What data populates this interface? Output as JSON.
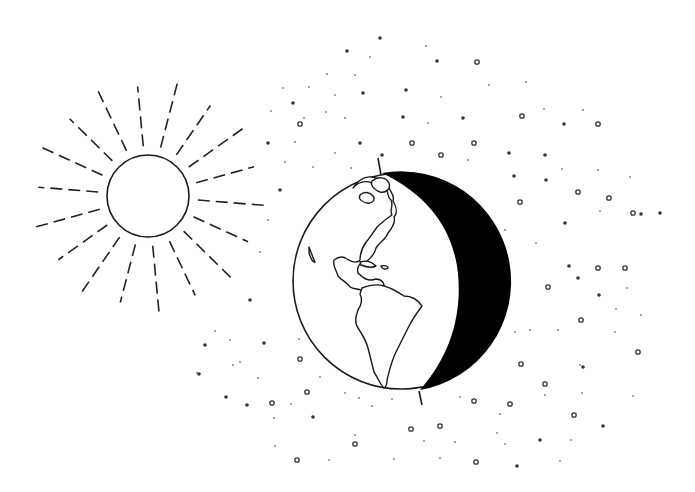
{
  "illustration": {
    "subject": "Sun illuminating Earth, night side shaded",
    "colors": {
      "background": "#ffffff",
      "ink": "#1a1a1a",
      "night": "#000000"
    },
    "sun": {
      "cx": 148,
      "cy": 196,
      "r": 41,
      "ray_inner": 50,
      "ray_outer": 118,
      "ray_count": 18
    },
    "earth": {
      "cx": 401,
      "cy": 281,
      "r": 108,
      "axis_top": [
        378,
        158,
        381,
        175
      ],
      "axis_bottom": [
        419,
        391,
        422,
        405
      ]
    },
    "stars": [
      [
        380,
        38,
        2,
        "d"
      ],
      [
        347,
        51,
        2,
        "d"
      ],
      [
        426,
        46,
        1,
        "p"
      ],
      [
        370,
        57,
        1,
        "p"
      ],
      [
        437,
        61,
        2,
        "d"
      ],
      [
        477,
        62,
        2,
        "r"
      ],
      [
        327,
        74,
        1,
        "p"
      ],
      [
        355,
        75,
        1,
        "p"
      ],
      [
        283,
        88,
        1,
        "p"
      ],
      [
        309,
        87,
        1,
        "p"
      ],
      [
        363,
        93,
        2,
        "d"
      ],
      [
        406,
        90,
        2,
        "d"
      ],
      [
        489,
        85,
        1,
        "p"
      ],
      [
        526,
        82,
        1,
        "p"
      ],
      [
        293,
        103,
        2,
        "d"
      ],
      [
        335,
        95,
        1,
        "p"
      ],
      [
        441,
        97,
        1,
        "p"
      ],
      [
        271,
        111,
        1,
        "p"
      ],
      [
        304,
        118,
        1,
        "p"
      ],
      [
        326,
        112,
        1,
        "p"
      ],
      [
        345,
        118,
        1,
        "p"
      ],
      [
        403,
        117,
        2,
        "d"
      ],
      [
        428,
        123,
        1,
        "p"
      ],
      [
        463,
        118,
        2,
        "d"
      ],
      [
        522,
        116,
        2,
        "r"
      ],
      [
        564,
        124,
        2,
        "d"
      ],
      [
        598,
        124,
        2,
        "r"
      ],
      [
        583,
        110,
        1,
        "p"
      ],
      [
        544,
        109,
        1,
        "p"
      ],
      [
        300,
        124,
        2,
        "r"
      ],
      [
        268,
        143,
        2,
        "d"
      ],
      [
        295,
        142,
        1,
        "p"
      ],
      [
        360,
        143,
        2,
        "d"
      ],
      [
        412,
        143,
        2,
        "r"
      ],
      [
        474,
        143,
        2,
        "r"
      ],
      [
        335,
        153,
        1,
        "p"
      ],
      [
        382,
        155,
        2,
        "d"
      ],
      [
        441,
        155,
        2,
        "r"
      ],
      [
        509,
        153,
        2,
        "d"
      ],
      [
        545,
        155,
        2,
        "d"
      ],
      [
        562,
        169,
        1,
        "p"
      ],
      [
        598,
        170,
        1,
        "p"
      ],
      [
        285,
        162,
        1,
        "p"
      ],
      [
        313,
        167,
        1,
        "p"
      ],
      [
        351,
        168,
        1,
        "p"
      ],
      [
        468,
        160,
        1,
        "p"
      ],
      [
        630,
        177,
        1,
        "p"
      ],
      [
        660,
        213,
        2,
        "d"
      ],
      [
        514,
        176,
        2,
        "d"
      ],
      [
        546,
        180,
        2,
        "d"
      ],
      [
        578,
        192,
        2,
        "r"
      ],
      [
        609,
        198,
        2,
        "r"
      ],
      [
        520,
        202,
        2,
        "r"
      ],
      [
        565,
        223,
        2,
        "d"
      ],
      [
        600,
        211,
        1,
        "p"
      ],
      [
        633,
        213,
        2,
        "r"
      ],
      [
        641,
        214,
        2,
        "d"
      ],
      [
        536,
        243,
        1,
        "p"
      ],
      [
        569,
        266,
        2,
        "d"
      ],
      [
        598,
        268,
        2,
        "r"
      ],
      [
        548,
        287,
        2,
        "r"
      ],
      [
        578,
        278,
        2,
        "d"
      ],
      [
        599,
        295,
        2,
        "d"
      ],
      [
        627,
        288,
        1,
        "p"
      ],
      [
        616,
        309,
        1,
        "p"
      ],
      [
        641,
        315,
        1,
        "p"
      ],
      [
        581,
        320,
        2,
        "r"
      ],
      [
        515,
        332,
        1,
        "p"
      ],
      [
        530,
        330,
        1,
        "p"
      ],
      [
        558,
        330,
        1,
        "p"
      ],
      [
        615,
        332,
        1,
        "p"
      ],
      [
        638,
        352,
        2,
        "r"
      ],
      [
        521,
        364,
        2,
        "r"
      ],
      [
        583,
        367,
        2,
        "d"
      ],
      [
        545,
        384,
        2,
        "r"
      ],
      [
        510,
        404,
        2,
        "r"
      ],
      [
        545,
        395,
        1,
        "p"
      ],
      [
        582,
        393,
        1,
        "p"
      ],
      [
        633,
        396,
        1,
        "p"
      ],
      [
        574,
        415,
        2,
        "r"
      ],
      [
        603,
        426,
        2,
        "d"
      ],
      [
        540,
        440,
        2,
        "d"
      ],
      [
        571,
        440,
        1,
        "p"
      ],
      [
        517,
        466,
        2,
        "d"
      ],
      [
        560,
        461,
        1,
        "p"
      ],
      [
        505,
        230,
        1,
        "p"
      ],
      [
        280,
        190,
        2,
        "d"
      ],
      [
        268,
        220,
        1,
        "p"
      ],
      [
        260,
        252,
        1,
        "p"
      ],
      [
        250,
        300,
        2,
        "d"
      ],
      [
        205,
        345,
        2,
        "d"
      ],
      [
        215,
        331,
        1,
        "p"
      ],
      [
        230,
        340,
        1,
        "p"
      ],
      [
        264,
        343,
        2,
        "d"
      ],
      [
        240,
        362,
        1,
        "p"
      ],
      [
        299,
        339,
        1,
        "p"
      ],
      [
        197,
        373,
        1,
        "p"
      ],
      [
        233,
        365,
        1,
        "p"
      ],
      [
        300,
        359,
        2,
        "r"
      ],
      [
        258,
        378,
        1,
        "p"
      ],
      [
        320,
        377,
        1,
        "p"
      ],
      [
        199,
        374,
        2,
        "d"
      ],
      [
        226,
        397,
        2,
        "d"
      ],
      [
        247,
        405,
        2,
        "d"
      ],
      [
        291,
        404,
        1,
        "p"
      ],
      [
        307,
        392,
        2,
        "r"
      ],
      [
        345,
        393,
        1,
        "p"
      ],
      [
        372,
        406,
        1,
        "p"
      ],
      [
        392,
        399,
        1,
        "p"
      ],
      [
        359,
        398,
        1,
        "p"
      ],
      [
        274,
        418,
        1,
        "p"
      ],
      [
        272,
        403,
        2,
        "r"
      ],
      [
        313,
        417,
        2,
        "d"
      ],
      [
        355,
        435,
        1,
        "p"
      ],
      [
        411,
        429,
        2,
        "r"
      ],
      [
        440,
        426,
        2,
        "r"
      ],
      [
        424,
        441,
        1,
        "p"
      ],
      [
        275,
        446,
        1,
        "p"
      ],
      [
        355,
        444,
        2,
        "r"
      ],
      [
        455,
        442,
        1,
        "p"
      ],
      [
        297,
        460,
        2,
        "r"
      ],
      [
        329,
        460,
        1,
        "p"
      ],
      [
        394,
        459,
        1,
        "p"
      ],
      [
        440,
        458,
        1,
        "p"
      ],
      [
        460,
        397,
        1,
        "p"
      ],
      [
        474,
        401,
        2,
        "r"
      ],
      [
        500,
        414,
        1,
        "p"
      ],
      [
        497,
        433,
        1,
        "p"
      ],
      [
        476,
        462,
        2,
        "r"
      ],
      [
        505,
        444,
        1,
        "p"
      ],
      [
        580,
        365,
        1,
        "p"
      ],
      [
        625,
        268,
        2,
        "r"
      ]
    ]
  }
}
